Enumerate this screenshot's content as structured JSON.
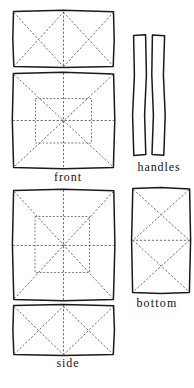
{
  "figure": {
    "kind": "sewing-pattern-cutting-diagram",
    "ink_color": "#1a1a1a",
    "guide_color": "#4d4d4d",
    "background_color": "#ffffff",
    "line_style": "dashed",
    "panel_count": 7
  },
  "labels": {
    "front": "front",
    "handles": "handles",
    "bottom": "bottom",
    "side": "side"
  },
  "panels": [
    {
      "id": "panel-top-rect",
      "label": "",
      "shape": "rectangle",
      "guides": "zigzag-double-x",
      "x": 13,
      "y": 11,
      "w": 101,
      "h": 56
    },
    {
      "id": "panel-front",
      "label": "front",
      "shape": "rectangle",
      "guides": "corner-diagonals-center-cross-inner-rectangle",
      "x": 13,
      "y": 73,
      "w": 101,
      "h": 95
    },
    {
      "id": "panel-handle-left",
      "label": "handles",
      "shape": "narrow-strip",
      "guides": "none",
      "x": 133,
      "y": 35,
      "w": 13,
      "h": 120
    },
    {
      "id": "panel-handle-right",
      "label": "handles",
      "shape": "narrow-strip",
      "guides": "none",
      "x": 152,
      "y": 35,
      "w": 13,
      "h": 120
    },
    {
      "id": "panel-side-large",
      "label": "",
      "shape": "rectangle",
      "guides": "corner-diagonals-center-cross-inner-rectangle-offset",
      "x": 13,
      "y": 190,
      "w": 101,
      "h": 110
    },
    {
      "id": "panel-bottom",
      "label": "bottom",
      "shape": "rectangle",
      "guides": "stacked-double-x",
      "x": 132,
      "y": 188,
      "w": 58,
      "h": 105
    },
    {
      "id": "panel-side",
      "label": "side",
      "shape": "rectangle",
      "guides": "zigzag-double-x",
      "x": 13,
      "y": 305,
      "w": 101,
      "h": 50
    }
  ]
}
